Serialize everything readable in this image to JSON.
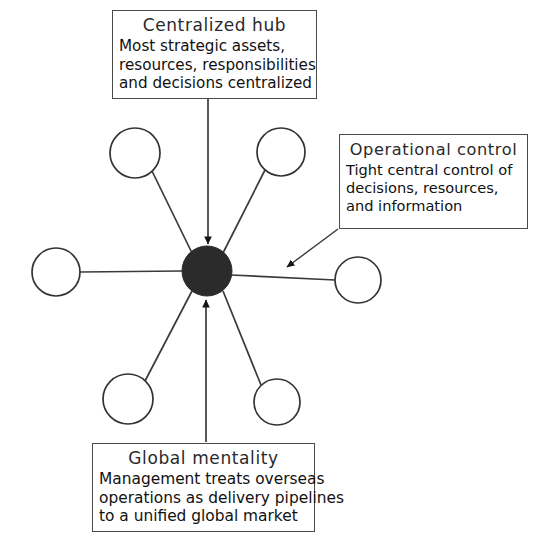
{
  "diagram": {
    "type": "hub-and-spoke",
    "title_visible": false,
    "background_color": "#ffffff",
    "line_color": "#3a3a3a",
    "hub": {
      "label": "central-hub-node",
      "fill_color": "#2b2b2b",
      "cx": 207,
      "cy": 271,
      "r": 25
    },
    "spokes": [
      {
        "name": "spoke-node-top-left",
        "cx": 135,
        "cy": 153,
        "r": 25,
        "arrow": false
      },
      {
        "name": "spoke-node-top-right",
        "cx": 281,
        "cy": 152,
        "r": 24,
        "arrow": false
      },
      {
        "name": "spoke-node-left",
        "cx": 56,
        "cy": 272,
        "r": 24,
        "arrow": false
      },
      {
        "name": "spoke-node-right",
        "cx": 358,
        "cy": 280,
        "r": 23,
        "arrow": false
      },
      {
        "name": "spoke-node-bottom-left",
        "cx": 128,
        "cy": 399,
        "r": 25,
        "arrow": false
      },
      {
        "name": "spoke-node-bottom-right",
        "cx": 277,
        "cy": 402,
        "r": 23,
        "arrow": false
      }
    ]
  },
  "callouts": {
    "centralized_hub": {
      "title": "Centralized hub",
      "lines": [
        "Most strategic assets,",
        "resources, responsibilities",
        "and decisions centralized"
      ],
      "arrow": "down-arrow-to-hub"
    },
    "operational_control": {
      "title": "Operational control",
      "lines": [
        "Tight central control of",
        "decisions, resources,",
        "and information"
      ],
      "arrow": "diagonal-arrow-to-hub"
    },
    "global_mentality": {
      "title": "Global mentality",
      "lines": [
        "Management treats overseas",
        "operations as delivery pipelines",
        "to a unified global market"
      ],
      "arrow": "up-arrow-to-hub"
    }
  }
}
